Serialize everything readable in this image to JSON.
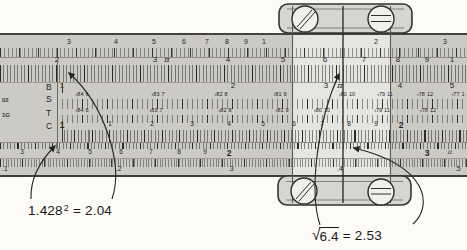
{
  "figure": {
    "type": "slide rule photograph (textbook figure: squares and square roots)",
    "slide_labels": [
      {
        "label": "B"
      },
      {
        "label": "S"
      },
      {
        "label": "T"
      },
      {
        "label": "C"
      }
    ],
    "edge_fragments": [
      {
        "text": "02"
      },
      {
        "text": "1G"
      }
    ],
    "scales": {
      "K": {
        "marks": [
          {
            "t": "3",
            "x": 69
          },
          {
            "t": "4",
            "x": 116
          },
          {
            "t": "5",
            "x": 154
          },
          {
            "t": "6",
            "x": 184
          },
          {
            "t": "7",
            "x": 207
          },
          {
            "t": "8",
            "x": 227
          },
          {
            "t": "9",
            "x": 246
          },
          {
            "t": "1",
            "x": 264
          },
          {
            "t": "2",
            "x": 376
          },
          {
            "t": "3",
            "x": 445
          }
        ]
      },
      "A": {
        "marks": [
          {
            "t": "2",
            "x": 57
          },
          {
            "t": "3",
            "x": 155
          },
          {
            "t": "π",
            "x": 167,
            "pi": true
          },
          {
            "t": "4",
            "x": 228
          },
          {
            "t": "5",
            "x": 283
          },
          {
            "t": "6",
            "x": 325
          },
          {
            "t": "7",
            "x": 364
          },
          {
            "t": "8",
            "x": 398
          },
          {
            "t": "9",
            "x": 427
          },
          {
            "t": "1",
            "x": 452
          }
        ]
      },
      "B": {
        "marks": [
          {
            "t": "1",
            "x": 62
          },
          {
            "t": "2",
            "x": 233
          },
          {
            "t": "3",
            "x": 326
          },
          {
            "t": "π",
            "x": 340,
            "pi": true
          },
          {
            "t": "4",
            "x": 400
          },
          {
            "t": "5",
            "x": 452
          }
        ]
      },
      "S": {
        "marks": [
          {
            "a": "‹84",
            "b": "6",
            "x": 82
          },
          {
            "a": "‹83",
            "b": "7",
            "x": 158
          },
          {
            "a": "‹82",
            "b": "8",
            "x": 221
          },
          {
            "a": "‹81",
            "b": "9",
            "x": 280
          },
          {
            "a": "‹80",
            "b": "10",
            "x": 347
          },
          {
            "a": "‹79",
            "b": "11",
            "x": 385
          },
          {
            "a": "‹78",
            "b": "12",
            "x": 425
          },
          {
            "a": "‹77",
            "b": "1",
            "x": 458
          }
        ]
      },
      "T": {
        "marks": [
          {
            "a": "‹84",
            "b": "6",
            "x": 82
          },
          {
            "a": "‹83",
            "b": "7",
            "x": 156
          },
          {
            "a": "‹82",
            "b": "8",
            "x": 225
          },
          {
            "a": "‹81",
            "b": "9",
            "x": 282
          },
          {
            "a": "‹80",
            "b": "10",
            "x": 322
          },
          {
            "a": "‹79",
            "b": "11",
            "x": 382
          },
          {
            "a": "‹78",
            "b": "12",
            "x": 428
          }
        ]
      },
      "C": {
        "marks": [
          {
            "t": "1",
            "x": 62,
            "big": true
          },
          {
            "t": "1",
            "x": 110
          },
          {
            "t": "2",
            "x": 152
          },
          {
            "t": "3",
            "x": 192
          },
          {
            "t": "4",
            "x": 229
          },
          {
            "t": "5",
            "x": 263
          },
          {
            "t": "6",
            "x": 294
          },
          {
            "t": "7",
            "x": 322
          },
          {
            "t": "8",
            "x": 349
          },
          {
            "t": "9",
            "x": 376
          },
          {
            "t": "2",
            "x": 401,
            "big": true
          }
        ]
      },
      "D": {
        "marks": [
          {
            "t": "3",
            "x": 22
          },
          {
            "t": "4",
            "x": 58
          },
          {
            "t": "5",
            "x": 90
          },
          {
            "t": "6",
            "x": 121
          },
          {
            "t": "7",
            "x": 151
          },
          {
            "t": "8",
            "x": 179
          },
          {
            "t": "9",
            "x": 205
          },
          {
            "t": "2",
            "x": 229,
            "big": true
          },
          {
            "t": "3",
            "x": 427,
            "big": true
          },
          {
            "t": "π",
            "x": 450,
            "pi": true
          }
        ]
      },
      "L": {
        "marks": [
          {
            "t": ".1",
            "x": 5
          },
          {
            "t": ".2",
            "x": 119
          },
          {
            "t": ".3",
            "x": 231
          },
          {
            "t": ".4",
            "x": 340
          },
          {
            "t": ".5",
            "x": 458
          }
        ]
      }
    },
    "annotations": {
      "square": {
        "base": "1.428",
        "exponent": "2",
        "result": "= 2.04"
      },
      "sqrt": {
        "radical_sign": "√",
        "radicand": "6.4",
        "result": "= 2.53"
      }
    }
  }
}
